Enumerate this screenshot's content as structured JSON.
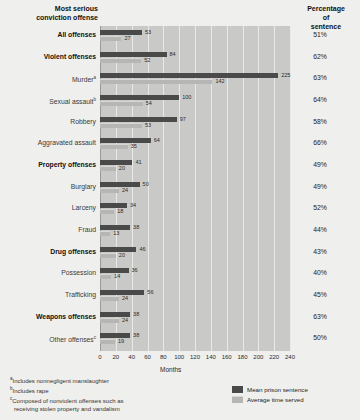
{
  "header": {
    "left_title_line1": "Most serious",
    "left_title_line2": "conviction offense",
    "right_title_line1": "Percentage",
    "right_title_line2": "of",
    "right_title_line3": "sentence"
  },
  "legend": {
    "mean_label": "Mean prison sentence",
    "served_label": "Average time served"
  },
  "footnotes": {
    "a": "Includes nonnegligent manslaughter",
    "b": "Includes rape",
    "c_line1": "Composed of nonviolent offenses such as",
    "c_line2": "receiving stolen property and vandalism",
    "marker_a": "a",
    "marker_b": "b",
    "marker_c": "c"
  },
  "chart_data": {
    "type": "bar",
    "orientation": "horizontal",
    "title": "Most serious conviction offense",
    "xlabel": "Months",
    "ylabel": "",
    "xlim": [
      0,
      240
    ],
    "xticks": [
      0,
      20,
      40,
      60,
      80,
      100,
      120,
      140,
      160,
      180,
      200,
      220,
      240
    ],
    "grid": true,
    "legend_position": "bottom-right",
    "series": [
      {
        "name": "Mean prison sentence",
        "color": "#4a4a4a",
        "values": [
          53,
          84,
          225,
          100,
          97,
          64,
          41,
          50,
          34,
          38,
          46,
          36,
          56,
          38,
          38
        ]
      },
      {
        "name": "Average time served",
        "color": "#b6b6b4",
        "values": [
          27,
          52,
          142,
          54,
          53,
          35,
          20,
          24,
          18,
          13,
          20,
          14,
          24,
          24,
          19
        ]
      }
    ],
    "categories": [
      "All offenses",
      "Violent offenses",
      "Murder",
      "Sexual assault",
      "Robbery",
      "Aggravated assault",
      "Property offenses",
      "Burglary",
      "Larceny",
      "Fraud",
      "Drug offenses",
      "Possession",
      "Trafficking",
      "Weapons offenses",
      "Other offenses"
    ],
    "percentage_of_sentence": [
      "51%",
      "62%",
      "63%",
      "64%",
      "58%",
      "66%",
      "49%",
      "49%",
      "52%",
      "44%",
      "43%",
      "40%",
      "45%",
      "63%",
      "50%"
    ]
  },
  "rows": [
    {
      "label": "All offenses",
      "bold": true,
      "sup": "",
      "mean": 53,
      "served": 27,
      "pct": "51%"
    },
    {
      "label": "Violent offenses",
      "bold": true,
      "sup": "",
      "mean": 84,
      "served": 52,
      "pct": "62%"
    },
    {
      "label": "Murder",
      "bold": false,
      "sup": "a",
      "mean": 225,
      "served": 142,
      "pct": "63%"
    },
    {
      "label": "Sexual assault",
      "bold": false,
      "sup": "b",
      "mean": 100,
      "served": 54,
      "pct": "64%"
    },
    {
      "label": "Robbery",
      "bold": false,
      "sup": "",
      "mean": 97,
      "served": 53,
      "pct": "58%"
    },
    {
      "label": "Aggravated assault",
      "bold": false,
      "sup": "",
      "mean": 64,
      "served": 35,
      "pct": "66%"
    },
    {
      "label": "Property offenses",
      "bold": true,
      "sup": "",
      "mean": 41,
      "served": 20,
      "pct": "49%"
    },
    {
      "label": "Burglary",
      "bold": false,
      "sup": "",
      "mean": 50,
      "served": 24,
      "pct": "49%"
    },
    {
      "label": "Larceny",
      "bold": false,
      "sup": "",
      "mean": 34,
      "served": 18,
      "pct": "52%"
    },
    {
      "label": "Fraud",
      "bold": false,
      "sup": "",
      "mean": 38,
      "served": 13,
      "pct": "44%"
    },
    {
      "label": "Drug offenses",
      "bold": true,
      "sup": "",
      "mean": 46,
      "served": 20,
      "pct": "43%"
    },
    {
      "label": "Possession",
      "bold": false,
      "sup": "",
      "mean": 36,
      "served": 14,
      "pct": "40%"
    },
    {
      "label": "Trafficking",
      "bold": false,
      "sup": "",
      "mean": 56,
      "served": 24,
      "pct": "45%"
    },
    {
      "label": "Weapons offenses",
      "bold": true,
      "sup": "",
      "mean": 38,
      "served": 24,
      "pct": "63%"
    },
    {
      "label": "Other offenses",
      "bold": false,
      "sup": "c",
      "mean": 38,
      "served": 19,
      "pct": "50%"
    }
  ]
}
